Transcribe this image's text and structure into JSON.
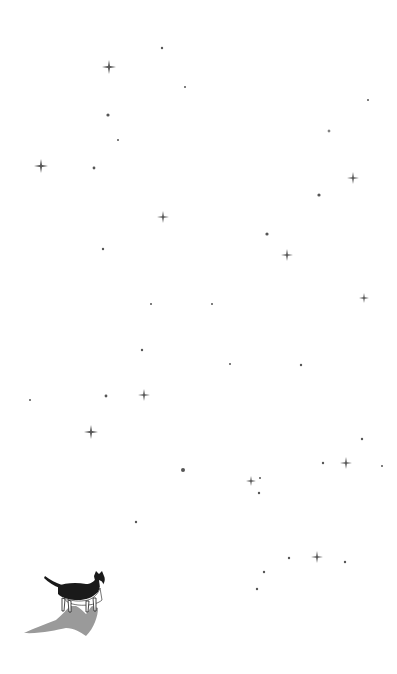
{
  "scene": {
    "description": "Minimal illustration of a black-and-white cat standing at the bottom-left, looking up at a night sky of sparkles and dots with a crescent moon",
    "background_color": "#ffffff",
    "ink_color": "#555555",
    "shadow_color": "#9a9a9a",
    "moon": {
      "cx": 272,
      "cy": 90,
      "r": 18,
      "color": "#555555"
    },
    "sparkles": [
      {
        "x": 109,
        "y": 67,
        "s": 7
      },
      {
        "x": 41,
        "y": 166,
        "s": 7
      },
      {
        "x": 353,
        "y": 178,
        "s": 6
      },
      {
        "x": 163,
        "y": 217,
        "s": 6
      },
      {
        "x": 287,
        "y": 255,
        "s": 6
      },
      {
        "x": 364,
        "y": 298,
        "s": 5
      },
      {
        "x": 144,
        "y": 395,
        "s": 6
      },
      {
        "x": 91,
        "y": 432,
        "s": 7
      },
      {
        "x": 346,
        "y": 463,
        "s": 6
      },
      {
        "x": 251,
        "y": 481,
        "s": 5
      },
      {
        "x": 317,
        "y": 557,
        "s": 6
      },
      {
        "x": 329,
        "y": 131,
        "s": 2
      }
    ],
    "dots": [
      {
        "x": 162,
        "y": 48,
        "r": 1.2
      },
      {
        "x": 185,
        "y": 87,
        "r": 1
      },
      {
        "x": 368,
        "y": 100,
        "r": 1
      },
      {
        "x": 108,
        "y": 115,
        "r": 1.6
      },
      {
        "x": 118,
        "y": 140,
        "r": 1
      },
      {
        "x": 94,
        "y": 168,
        "r": 1.4
      },
      {
        "x": 319,
        "y": 195,
        "r": 1.6
      },
      {
        "x": 267,
        "y": 234,
        "r": 1.6
      },
      {
        "x": 103,
        "y": 249,
        "r": 1.2
      },
      {
        "x": 151,
        "y": 304,
        "r": 1
      },
      {
        "x": 212,
        "y": 304,
        "r": 1
      },
      {
        "x": 142,
        "y": 350,
        "r": 1.2
      },
      {
        "x": 230,
        "y": 364,
        "r": 1
      },
      {
        "x": 301,
        "y": 365,
        "r": 1.2
      },
      {
        "x": 106,
        "y": 396,
        "r": 1.4
      },
      {
        "x": 30,
        "y": 400,
        "r": 1
      },
      {
        "x": 362,
        "y": 439,
        "r": 1.2
      },
      {
        "x": 183,
        "y": 470,
        "r": 2
      },
      {
        "x": 323,
        "y": 463,
        "r": 1.2
      },
      {
        "x": 382,
        "y": 466,
        "r": 1
      },
      {
        "x": 260,
        "y": 478,
        "r": 1
      },
      {
        "x": 259,
        "y": 493,
        "r": 1.2
      },
      {
        "x": 136,
        "y": 522,
        "r": 1.2
      },
      {
        "x": 289,
        "y": 558,
        "r": 1.2
      },
      {
        "x": 345,
        "y": 562,
        "r": 1.2
      },
      {
        "x": 264,
        "y": 572,
        "r": 1.2
      },
      {
        "x": 257,
        "y": 589,
        "r": 1.2
      }
    ]
  }
}
